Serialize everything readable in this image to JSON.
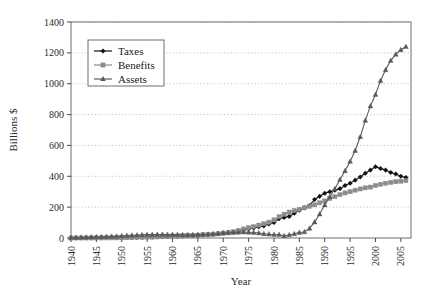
{
  "chart_data": {
    "type": "line",
    "title": "",
    "xlabel": "Year",
    "ylabel": "Billions $",
    "xlim": [
      1940,
      2007
    ],
    "ylim": [
      0,
      1400
    ],
    "ytick_step": 200,
    "xtick_step": 5,
    "grid": "horizontal-dotted",
    "legend_position": "upper-left-inside",
    "yticks": [
      "0",
      "200",
      "400",
      "600",
      "800",
      "1000",
      "1200",
      "1400"
    ],
    "xticks": [
      "1940",
      "1945",
      "1950",
      "1955",
      "1960",
      "1965",
      "1970",
      "1975",
      "1980",
      "1985",
      "1990",
      "1995",
      "2000",
      "2005"
    ],
    "x": [
      1940,
      1941,
      1942,
      1943,
      1944,
      1945,
      1946,
      1947,
      1948,
      1949,
      1950,
      1951,
      1952,
      1953,
      1954,
      1955,
      1956,
      1957,
      1958,
      1959,
      1960,
      1961,
      1962,
      1963,
      1964,
      1965,
      1966,
      1967,
      1968,
      1969,
      1970,
      1971,
      1972,
      1973,
      1974,
      1975,
      1976,
      1977,
      1978,
      1979,
      1980,
      1981,
      1982,
      1983,
      1984,
      1985,
      1986,
      1987,
      1988,
      1989,
      1990,
      1991,
      1992,
      1993,
      1994,
      1995,
      1996,
      1997,
      1998,
      1999,
      2000,
      2001,
      2002,
      2003,
      2004,
      2005,
      2006
    ],
    "series": [
      {
        "name": "Taxes",
        "marker": "diamond",
        "color": "#111111",
        "values": [
          0.3,
          0.4,
          0.5,
          0.7,
          0.9,
          1.0,
          1.2,
          1.5,
          1.7,
          1.8,
          2.1,
          3.4,
          3.8,
          4.1,
          5.2,
          6.2,
          6.9,
          7.4,
          8.1,
          8.5,
          11.9,
          12.3,
          13.0,
          15.1,
          16.7,
          17.2,
          20.7,
          24.2,
          25.0,
          29.6,
          32.2,
          35.9,
          40.1,
          46.0,
          52.1,
          58.7,
          64.8,
          72.4,
          78.1,
          90.3,
          100.0,
          125.0,
          133.0,
          140.0,
          160.0,
          180.0,
          195.0,
          210.0,
          250.0,
          270.0,
          290.0,
          300.0,
          310.0,
          320.0,
          340.0,
          355.0,
          375.0,
          395.0,
          420.0,
          440.0,
          462.0,
          450.0,
          440.0,
          425.0,
          415.0,
          400.0,
          392.0
        ]
      },
      {
        "name": "Benefits",
        "marker": "square",
        "color": "#8c8c8c",
        "values": [
          0.1,
          0.1,
          0.2,
          0.2,
          0.3,
          0.3,
          0.4,
          0.5,
          0.6,
          0.7,
          1.0,
          1.9,
          2.2,
          3.0,
          3.7,
          4.9,
          5.7,
          7.5,
          8.6,
          9.8,
          11.2,
          12.4,
          14.4,
          15.2,
          16.0,
          18.3,
          20.7,
          21.4,
          23.6,
          26.8,
          31.9,
          37.2,
          40.2,
          49.1,
          58.5,
          67.0,
          73.9,
          83.1,
          92.2,
          102.5,
          117.1,
          138.0,
          154.0,
          168.0,
          178.0,
          186.0,
          196.0,
          205.0,
          215.0,
          228.0,
          240.0,
          256.0,
          268.0,
          281.0,
          292.0,
          300.0,
          310.0,
          318.0,
          325.0,
          330.0,
          340.0,
          348.0,
          355.0,
          360.0,
          365.0,
          368.0,
          372.0
        ]
      },
      {
        "name": "Assets",
        "marker": "triangle",
        "color": "#595959",
        "values": [
          2.0,
          2.8,
          3.7,
          4.8,
          6.0,
          7.1,
          8.1,
          9.4,
          10.7,
          11.3,
          13.7,
          15.5,
          17.4,
          18.7,
          20.6,
          21.7,
          22.5,
          23.0,
          23.0,
          21.9,
          22.6,
          22.2,
          20.7,
          20.7,
          21.2,
          22.1,
          22.3,
          24.2,
          26.3,
          29.0,
          32.5,
          33.6,
          35.3,
          36.5,
          38.8,
          37.0,
          35.4,
          32.5,
          27.5,
          24.7,
          22.8,
          21.5,
          14.4,
          19.7,
          27.1,
          35.8,
          39.1,
          62.1,
          102.9,
          155.0,
          214.0,
          267.0,
          319.0,
          378.0,
          436.0,
          496.0,
          567.0,
          656.0,
          762.0,
          855.0,
          930.0,
          1020.0,
          1090.0,
          1150.0,
          1190.0,
          1220.0,
          1240.0
        ]
      }
    ]
  },
  "legend": {
    "entries": [
      {
        "label": "Taxes"
      },
      {
        "label": "Benefits"
      },
      {
        "label": "Assets"
      }
    ]
  }
}
